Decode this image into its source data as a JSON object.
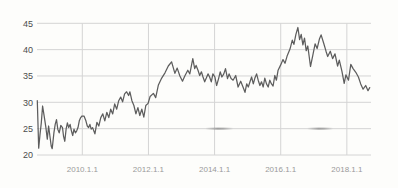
{
  "chart_data": {
    "type": "line",
    "title": "",
    "xlabel": "",
    "ylabel": "",
    "grid": true,
    "legend": false,
    "ylim": [
      20,
      45
    ],
    "x_range_years": [
      2008.63,
      2018.73
    ],
    "y_ticks": [
      45,
      40,
      35,
      30,
      25,
      20
    ],
    "x_ticks": [
      {
        "year": 2010,
        "label": "2010.1.1"
      },
      {
        "year": 2012,
        "label": "2012.1.1"
      },
      {
        "year": 2014,
        "label": "2014.1.1"
      },
      {
        "year": 2016,
        "label": "2016.1.1"
      },
      {
        "year": 2018,
        "label": "2018.1.1"
      }
    ],
    "series": [
      {
        "name": "price",
        "color": "#5d5d5d",
        "points": [
          [
            2008.64,
            30.3
          ],
          [
            2008.68,
            21.3
          ],
          [
            2008.72,
            23.9
          ],
          [
            2008.76,
            26.1
          ],
          [
            2008.8,
            29.3
          ],
          [
            2008.84,
            27.7
          ],
          [
            2008.87,
            26.5
          ],
          [
            2008.9,
            25.2
          ],
          [
            2008.94,
            23.0
          ],
          [
            2008.98,
            25.5
          ],
          [
            2009.02,
            23.6
          ],
          [
            2009.06,
            21.7
          ],
          [
            2009.09,
            21.2
          ],
          [
            2009.14,
            24.2
          ],
          [
            2009.18,
            25.8
          ],
          [
            2009.22,
            26.7
          ],
          [
            2009.26,
            24.9
          ],
          [
            2009.3,
            24.2
          ],
          [
            2009.35,
            25.6
          ],
          [
            2009.4,
            25.2
          ],
          [
            2009.43,
            23.6
          ],
          [
            2009.47,
            22.6
          ],
          [
            2009.51,
            24.9
          ],
          [
            2009.55,
            26.1
          ],
          [
            2009.59,
            25.2
          ],
          [
            2009.63,
            25.8
          ],
          [
            2009.67,
            24.6
          ],
          [
            2009.71,
            23.7
          ],
          [
            2009.75,
            24.9
          ],
          [
            2009.79,
            24.2
          ],
          [
            2009.83,
            24.6
          ],
          [
            2009.87,
            25.2
          ],
          [
            2009.91,
            26.5
          ],
          [
            2009.95,
            27.1
          ],
          [
            2009.99,
            27.4
          ],
          [
            2010.05,
            27.4
          ],
          [
            2010.11,
            26.5
          ],
          [
            2010.15,
            25.5
          ],
          [
            2010.19,
            25.2
          ],
          [
            2010.23,
            25.8
          ],
          [
            2010.27,
            24.9
          ],
          [
            2010.31,
            25.2
          ],
          [
            2010.38,
            24.0
          ],
          [
            2010.44,
            26.2
          ],
          [
            2010.5,
            25.5
          ],
          [
            2010.56,
            27.1
          ],
          [
            2010.62,
            27.8
          ],
          [
            2010.68,
            26.5
          ],
          [
            2010.74,
            28.1
          ],
          [
            2010.8,
            27.1
          ],
          [
            2010.86,
            28.7
          ],
          [
            2010.92,
            27.8
          ],
          [
            2010.98,
            29.7
          ],
          [
            2011.04,
            28.7
          ],
          [
            2011.1,
            30.3
          ],
          [
            2011.16,
            31.0
          ],
          [
            2011.22,
            30.1
          ],
          [
            2011.28,
            31.6
          ],
          [
            2011.34,
            32.0
          ],
          [
            2011.4,
            31.3
          ],
          [
            2011.44,
            32.0
          ],
          [
            2011.5,
            30.3
          ],
          [
            2011.56,
            29.4
          ],
          [
            2011.62,
            27.8
          ],
          [
            2011.68,
            29.0
          ],
          [
            2011.74,
            27.5
          ],
          [
            2011.8,
            28.7
          ],
          [
            2011.86,
            27.2
          ],
          [
            2011.92,
            29.4
          ],
          [
            2011.99,
            29.8
          ],
          [
            2012.05,
            31.1
          ],
          [
            2012.15,
            31.7
          ],
          [
            2012.22,
            30.9
          ],
          [
            2012.3,
            33.3
          ],
          [
            2012.4,
            34.6
          ],
          [
            2012.5,
            35.6
          ],
          [
            2012.6,
            36.9
          ],
          [
            2012.7,
            37.7
          ],
          [
            2012.8,
            35.5
          ],
          [
            2012.87,
            36.5
          ],
          [
            2012.95,
            35.0
          ],
          [
            2013.03,
            34.0
          ],
          [
            2013.1,
            35.0
          ],
          [
            2013.19,
            36.1
          ],
          [
            2013.25,
            35.4
          ],
          [
            2013.34,
            38.3
          ],
          [
            2013.4,
            36.4
          ],
          [
            2013.44,
            37.0
          ],
          [
            2013.5,
            36.1
          ],
          [
            2013.55,
            35.1
          ],
          [
            2013.6,
            35.8
          ],
          [
            2013.65,
            34.8
          ],
          [
            2013.7,
            33.9
          ],
          [
            2013.75,
            34.6
          ],
          [
            2013.8,
            35.4
          ],
          [
            2013.85,
            34.8
          ],
          [
            2013.9,
            33.9
          ],
          [
            2013.95,
            35.4
          ],
          [
            2014.01,
            34.8
          ],
          [
            2014.06,
            33.2
          ],
          [
            2014.12,
            34.5
          ],
          [
            2014.17,
            35.8
          ],
          [
            2014.22,
            34.8
          ],
          [
            2014.28,
            35.4
          ],
          [
            2014.33,
            36.4
          ],
          [
            2014.39,
            34.5
          ],
          [
            2014.44,
            35.4
          ],
          [
            2014.5,
            34.5
          ],
          [
            2014.56,
            34.2
          ],
          [
            2014.64,
            35.1
          ],
          [
            2014.71,
            32.9
          ],
          [
            2014.79,
            34.0
          ],
          [
            2014.86,
            32.9
          ],
          [
            2014.92,
            31.9
          ],
          [
            2014.97,
            33.5
          ],
          [
            2015.02,
            32.9
          ],
          [
            2015.07,
            33.9
          ],
          [
            2015.12,
            34.8
          ],
          [
            2015.17,
            33.5
          ],
          [
            2015.22,
            34.6
          ],
          [
            2015.27,
            35.4
          ],
          [
            2015.32,
            34.2
          ],
          [
            2015.37,
            33.2
          ],
          [
            2015.42,
            33.9
          ],
          [
            2015.47,
            32.9
          ],
          [
            2015.52,
            34.6
          ],
          [
            2015.57,
            33.5
          ],
          [
            2015.62,
            32.9
          ],
          [
            2015.67,
            34.2
          ],
          [
            2015.72,
            33.5
          ],
          [
            2015.77,
            33.1
          ],
          [
            2015.82,
            35.1
          ],
          [
            2015.87,
            34.2
          ],
          [
            2015.92,
            36.1
          ],
          [
            2016.0,
            37.1
          ],
          [
            2016.07,
            38.1
          ],
          [
            2016.13,
            37.4
          ],
          [
            2016.2,
            38.9
          ],
          [
            2016.28,
            40.1
          ],
          [
            2016.35,
            41.8
          ],
          [
            2016.4,
            41.0
          ],
          [
            2016.46,
            42.9
          ],
          [
            2016.52,
            44.2
          ],
          [
            2016.57,
            41.9
          ],
          [
            2016.62,
            42.9
          ],
          [
            2016.67,
            40.9
          ],
          [
            2016.72,
            42.2
          ],
          [
            2016.77,
            39.8
          ],
          [
            2016.82,
            40.7
          ],
          [
            2016.9,
            36.8
          ],
          [
            2016.97,
            38.9
          ],
          [
            2017.04,
            41.1
          ],
          [
            2017.1,
            40.2
          ],
          [
            2017.17,
            42.0
          ],
          [
            2017.22,
            42.8
          ],
          [
            2017.3,
            41.2
          ],
          [
            2017.37,
            39.7
          ],
          [
            2017.42,
            38.7
          ],
          [
            2017.5,
            39.7
          ],
          [
            2017.57,
            38.3
          ],
          [
            2017.64,
            39.2
          ],
          [
            2017.72,
            36.9
          ],
          [
            2017.77,
            38.0
          ],
          [
            2017.85,
            35.9
          ],
          [
            2017.92,
            33.6
          ],
          [
            2017.97,
            35.2
          ],
          [
            2018.05,
            34.2
          ],
          [
            2018.12,
            37.2
          ],
          [
            2018.19,
            36.4
          ],
          [
            2018.27,
            35.7
          ],
          [
            2018.35,
            34.8
          ],
          [
            2018.42,
            33.5
          ],
          [
            2018.49,
            32.5
          ],
          [
            2018.57,
            33.2
          ],
          [
            2018.64,
            32.2
          ],
          [
            2018.69,
            32.8
          ]
        ]
      }
    ],
    "artifacts": {
      "smudges_on_gridline_25": [
        {
          "start_year": 2013.72,
          "end_year": 2014.56
        },
        {
          "start_year": 2016.8,
          "end_year": 2017.58
        }
      ]
    }
  },
  "colors": {
    "background": "#fdfdfb",
    "line": "#5d5d5d",
    "grid": "#d4d4d4",
    "y_label": "#4c4c4c",
    "x_label": "#9a9a9a",
    "smudge": "#6e6e6e"
  }
}
